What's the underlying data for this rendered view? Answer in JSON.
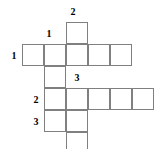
{
  "puzzle": {
    "type": "crossword-grid",
    "grid_origin": {
      "x": 22,
      "y": 22
    },
    "cell_size": 22,
    "colors": {
      "cell_border": "#808080",
      "cell_fill": "#ffffff",
      "label_text": "#000000",
      "background": "#ffffff"
    },
    "cells": [
      {
        "name": "cell-r0-c2",
        "col": 2,
        "row": 0,
        "value": ""
      },
      {
        "name": "cell-r1-c0",
        "col": 0,
        "row": 1,
        "value": ""
      },
      {
        "name": "cell-r1-c1",
        "col": 1,
        "row": 1,
        "value": ""
      },
      {
        "name": "cell-r1-c2",
        "col": 2,
        "row": 1,
        "value": ""
      },
      {
        "name": "cell-r1-c3",
        "col": 3,
        "row": 1,
        "value": ""
      },
      {
        "name": "cell-r1-c4",
        "col": 4,
        "row": 1,
        "value": ""
      },
      {
        "name": "cell-r2-c1",
        "col": 1,
        "row": 2,
        "value": ""
      },
      {
        "name": "cell-r3-c1",
        "col": 1,
        "row": 3,
        "value": ""
      },
      {
        "name": "cell-r3-c2",
        "col": 2,
        "row": 3,
        "value": ""
      },
      {
        "name": "cell-r3-c3",
        "col": 3,
        "row": 3,
        "value": ""
      },
      {
        "name": "cell-r3-c4",
        "col": 4,
        "row": 3,
        "value": ""
      },
      {
        "name": "cell-r3-c5",
        "col": 5,
        "row": 3,
        "value": ""
      },
      {
        "name": "cell-r4-c1",
        "col": 1,
        "row": 4,
        "value": ""
      },
      {
        "name": "cell-r4-c2",
        "col": 2,
        "row": 4,
        "value": ""
      },
      {
        "name": "cell-r5-c2",
        "col": 2,
        "row": 5,
        "value": ""
      }
    ],
    "labels": [
      {
        "name": "clue-label-down-2",
        "text": "2",
        "x": 67,
        "y": 6,
        "direction": "down",
        "for_cell": "cell-r0-c2"
      },
      {
        "name": "clue-label-down-1",
        "text": "1",
        "x": 43,
        "y": 28,
        "direction": "down",
        "for_cell": "cell-r1-c1"
      },
      {
        "name": "clue-label-across-1",
        "text": "1",
        "x": 8,
        "y": 50,
        "direction": "across",
        "for_cell": "cell-r1-c0"
      },
      {
        "name": "clue-label-down-3",
        "text": "3",
        "x": 71,
        "y": 72,
        "direction": "down",
        "for_cell": "cell-r3-c3"
      },
      {
        "name": "clue-label-across-2",
        "text": "2",
        "x": 30,
        "y": 94,
        "direction": "across",
        "for_cell": "cell-r3-c1"
      },
      {
        "name": "clue-label-across-3",
        "text": "3",
        "x": 30,
        "y": 116,
        "direction": "across",
        "for_cell": "cell-r4-c1"
      }
    ]
  }
}
